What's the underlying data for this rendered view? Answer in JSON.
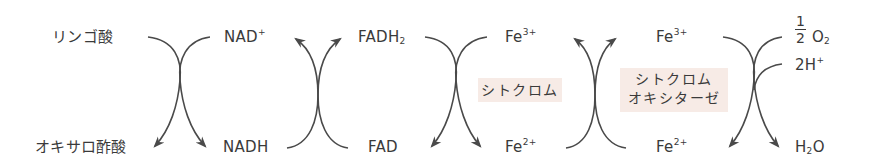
{
  "diagram": {
    "type": "electron-transport-redox-chain",
    "top_row": {
      "malate": "リンゴ酸",
      "nad": "NAD",
      "nad_charge": "+",
      "fadh": "FADH",
      "fadh_sub": "2",
      "fe3_a": "Fe",
      "fe3_a_charge": "3+",
      "fe3_b": "Fe",
      "fe3_b_charge": "3+",
      "oxygen_num": "1",
      "oxygen_den": "2",
      "oxygen": "O",
      "oxygen_sub": "2",
      "proton": "2H",
      "proton_charge": "+"
    },
    "bottom_row": {
      "oxaloacetate": "オキサロ酢酸",
      "nadh": "NADH",
      "fad": "FAD",
      "fe2_a": "Fe",
      "fe2_a_charge": "2+",
      "fe2_b": "Fe",
      "fe2_b_charge": "2+",
      "water_h": "H",
      "water_sub": "2",
      "water_o": "O"
    },
    "enzymes": {
      "cytochrome": "シトクロム",
      "cytochrome_oxidase_line1": "シトクロム",
      "cytochrome_oxidase_line2": "オキシターゼ"
    },
    "colors": {
      "text": "#3a3a3a",
      "arrow": "#4a4a4a",
      "enzyme_box": "#f7ebe6"
    },
    "arrow_pairs": [
      {
        "between": "リンゴ酸/NAD+ → オキサロ酢酸/NADH",
        "direction": "down"
      },
      {
        "between": "NADH/FAD → NAD+/FADH2",
        "direction": "up"
      },
      {
        "between": "FADH2/Fe3+ → FAD/Fe2+",
        "direction": "down"
      },
      {
        "between": "Fe2+/Fe2+ → Fe3+/Fe3+",
        "direction": "up"
      },
      {
        "between": "Fe3+/O2/2H+ → Fe2+/H2O",
        "direction": "down"
      }
    ]
  }
}
